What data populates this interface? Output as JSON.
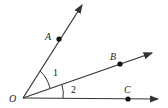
{
  "diagram": {
    "points": {
      "O": "O",
      "A": "A",
      "B": "B",
      "C": "C"
    },
    "angles": {
      "angle1": "1",
      "angle2": "2"
    },
    "rays": [
      "OA",
      "OB",
      "OC"
    ],
    "colors": {
      "stroke": "#333333",
      "fill": "#111111"
    }
  }
}
